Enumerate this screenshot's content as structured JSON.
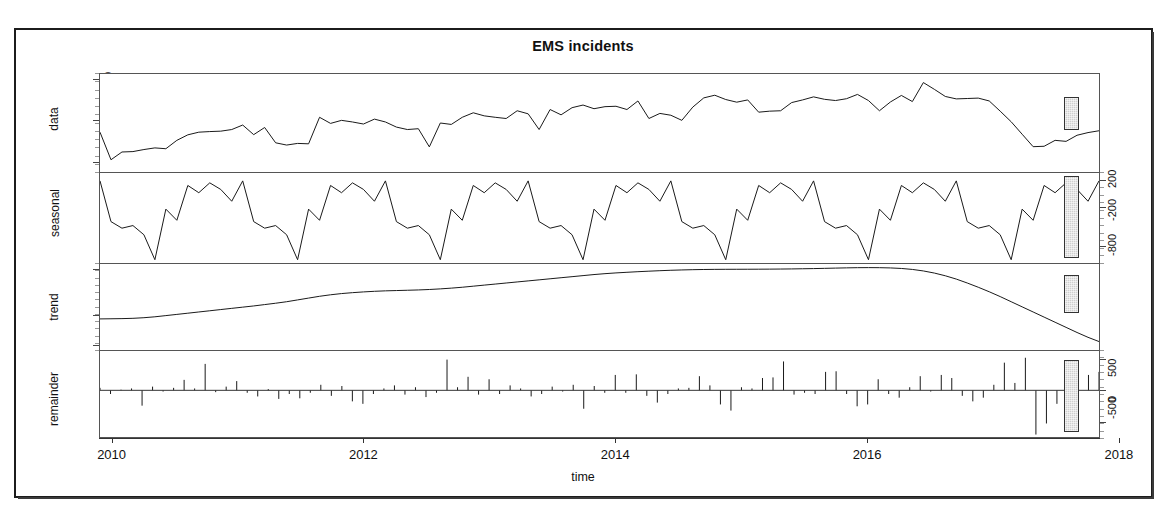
{
  "chart_data": {
    "type": "line",
    "title": "EMS incidents",
    "xlabel": "time",
    "ylabel": "",
    "subtype": "stl-decomposition",
    "grid": false,
    "legend_position": "none",
    "xlim": [
      2009.9,
      2017.85
    ],
    "xticks": [
      2010,
      2012,
      2014,
      2016,
      2018
    ],
    "xticklabels": [
      "2010",
      "2012",
      "2014",
      "2016",
      "2018"
    ],
    "panels": [
      {
        "name": "data",
        "label": "data",
        "axis_side": "left",
        "ylim": [
          7500,
          12300
        ],
        "yticks": [
          8000,
          10000,
          12000
        ],
        "yticklabels": [
          "8000",
          "10000",
          "12000"
        ],
        "series_type": "line",
        "values": [
          9450,
          8100,
          8480,
          8500,
          8600,
          8680,
          8640,
          9050,
          9320,
          9450,
          9480,
          9500,
          9580,
          9800,
          9330,
          9680,
          8930,
          8820,
          8900,
          8880,
          10180,
          9880,
          10030,
          9950,
          9850,
          10090,
          9950,
          9700,
          9580,
          9620,
          8730,
          9900,
          9830,
          10180,
          10400,
          10250,
          10180,
          10120,
          10500,
          10350,
          9580,
          10560,
          10300,
          10650,
          10780,
          10600,
          10700,
          10720,
          10560,
          10980,
          10120,
          10370,
          10280,
          10030,
          10680,
          11130,
          11260,
          11050,
          10920,
          11030,
          10430,
          10480,
          10500,
          10900,
          11030,
          11180,
          11060,
          11000,
          11090,
          11300,
          11000,
          10500,
          10930,
          11250,
          10950,
          11880,
          11550,
          11200,
          11080,
          11100,
          11120,
          10980,
          10480,
          9960,
          9350,
          8740,
          8760,
          9050,
          9000,
          9300,
          9430,
          9520
        ]
      },
      {
        "name": "seasonal",
        "label": "seasonal",
        "axis_side": "right",
        "ylim": [
          -1050,
          320
        ],
        "yticks": [
          200,
          -200,
          -800
        ],
        "yticklabels": [
          "200",
          "-200",
          "-800"
        ],
        "series_type": "line",
        "values": [
          200,
          -420,
          -520,
          -480,
          -620,
          -1000,
          -230,
          -400,
          130,
          20,
          170,
          70,
          -110,
          200,
          -420,
          -520,
          -480,
          -620,
          -1000,
          -230,
          -400,
          130,
          20,
          170,
          70,
          -110,
          200,
          -420,
          -520,
          -480,
          -620,
          -1000,
          -230,
          -400,
          130,
          20,
          170,
          70,
          -110,
          200,
          -420,
          -520,
          -480,
          -620,
          -1000,
          -230,
          -400,
          130,
          20,
          170,
          70,
          -110,
          200,
          -420,
          -520,
          -480,
          -620,
          -1000,
          -230,
          -400,
          130,
          20,
          170,
          70,
          -110,
          200,
          -420,
          -520,
          -480,
          -620,
          -1000,
          -230,
          -400,
          130,
          20,
          170,
          70,
          -110,
          200,
          -420,
          -520,
          -480,
          -620,
          -1000,
          -230,
          -400,
          130,
          20,
          170,
          70,
          -110,
          200
        ]
      },
      {
        "name": "trend",
        "label": "trend",
        "axis_side": "left",
        "ylim": [
          7850,
          10700
        ],
        "yticks": [
          8000,
          9000,
          10500
        ],
        "yticklabels": [
          "8000",
          "9000",
          "10500"
        ],
        "series_type": "line",
        "values": [
          8880,
          8885,
          8890,
          8900,
          8920,
          8950,
          8990,
          9030,
          9070,
          9110,
          9150,
          9190,
          9230,
          9270,
          9310,
          9355,
          9400,
          9450,
          9510,
          9570,
          9630,
          9680,
          9720,
          9750,
          9775,
          9795,
          9810,
          9820,
          9830,
          9840,
          9855,
          9875,
          9900,
          9930,
          9965,
          10000,
          10035,
          10070,
          10105,
          10140,
          10175,
          10210,
          10245,
          10280,
          10315,
          10350,
          10380,
          10405,
          10425,
          10445,
          10462,
          10478,
          10492,
          10503,
          10512,
          10518,
          10522,
          10524,
          10525,
          10526,
          10528,
          10530,
          10533,
          10537,
          10542,
          10548,
          10556,
          10564,
          10572,
          10578,
          10580,
          10578,
          10570,
          10552,
          10520,
          10470,
          10400,
          10310,
          10200,
          10070,
          9930,
          9780,
          9620,
          9450,
          9280,
          9110,
          8940,
          8770,
          8600,
          8430,
          8270,
          8130
        ]
      },
      {
        "name": "remainder",
        "label": "remainder",
        "axis_side": "right",
        "ylim": [
          -760,
          640
        ],
        "yticks": [
          500,
          0,
          -500
        ],
        "yticklabels": [
          "500",
          "0",
          "-500"
        ],
        "series_type": "bar",
        "values": [
          40,
          -60,
          10,
          30,
          -250,
          60,
          -20,
          40,
          170,
          30,
          430,
          -30,
          60,
          150,
          -40,
          -100,
          20,
          -140,
          -60,
          -130,
          -40,
          90,
          -90,
          70,
          -180,
          -220,
          -60,
          30,
          80,
          -70,
          50,
          -110,
          -40,
          500,
          50,
          220,
          -70,
          180,
          -60,
          80,
          30,
          -100,
          -60,
          60,
          -20,
          90,
          -300,
          70,
          -40,
          250,
          -40,
          260,
          -90,
          -200,
          -60,
          30,
          40,
          230,
          80,
          -230,
          -330,
          50,
          30,
          200,
          210,
          470,
          -70,
          -40,
          -60,
          300,
          310,
          -60,
          -260,
          -230,
          180,
          -60,
          -120,
          50,
          230,
          -20,
          250,
          200,
          -90,
          -180,
          -120,
          90,
          450,
          120,
          530,
          -720,
          -540,
          -220,
          -130,
          80,
          250,
          300
        ]
      }
    ],
    "range_bars": [
      {
        "panel": "data",
        "top_frac": 0.23,
        "height_frac": 0.33
      },
      {
        "panel": "seasonal",
        "top_frac": 0.03,
        "height_frac": 0.9
      },
      {
        "panel": "trend",
        "top_frac": 0.13,
        "height_frac": 0.44
      },
      {
        "panel": "remainder",
        "top_frac": 0.1,
        "height_frac": 0.82
      }
    ]
  },
  "axes": {
    "x_title": "time",
    "x_ticklabels": [
      "2010",
      "2012",
      "2014",
      "2016",
      "2018"
    ],
    "left_panel_names": [
      "data",
      "trend"
    ],
    "right_panel_names": [
      "seasonal",
      "remainder"
    ]
  }
}
